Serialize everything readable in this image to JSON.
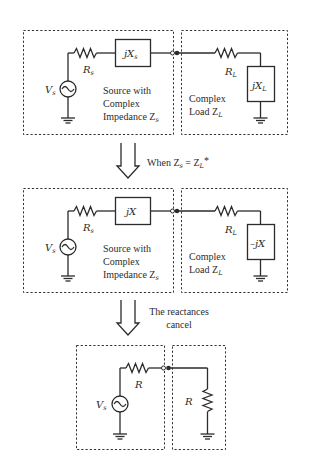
{
  "diagram": {
    "panel1": {
      "source_label": "V",
      "source_sub": "s",
      "resistor_label": "R",
      "resistor_sub": "s",
      "reactance_label": "jX",
      "reactance_sub": "s",
      "source_caption_line1": "Source with",
      "source_caption_line2": "Complex",
      "source_caption_line3": "Impedance Z",
      "source_caption_sub": "s",
      "load_resistor_label": "R",
      "load_resistor_sub": "L",
      "load_reactance_label": "jX",
      "load_reactance_sub": "L",
      "load_caption_line1": "Complex",
      "load_caption_line2": "Load Z",
      "load_caption_sub": "L"
    },
    "arrow1": {
      "text_prefix": "When Z",
      "text_sub1": "s",
      "text_mid": " = Z",
      "text_sub2": "L",
      "text_suffix": "*"
    },
    "panel2": {
      "source_label": "V",
      "source_sub": "s",
      "resistor_label": "R",
      "resistor_sub": "s",
      "reactance_label": "jX",
      "source_caption_line1": "Source with",
      "source_caption_line2": "Complex",
      "source_caption_line3": "Impedance Z",
      "source_caption_sub": "s",
      "load_resistor_label": "R",
      "load_resistor_sub": "L",
      "load_reactance_label": "–jX",
      "load_caption_line1": "Complex",
      "load_caption_line2": "Load Z",
      "load_caption_sub": "L"
    },
    "arrow2": {
      "line1": "The reactances",
      "line2": "cancel"
    },
    "panel3": {
      "source_label": "V",
      "source_sub": "s",
      "resistor_label": "R",
      "load_resistor_label": "R"
    },
    "colors": {
      "line": "#2b2b2b",
      "background": "#ffffff"
    }
  }
}
